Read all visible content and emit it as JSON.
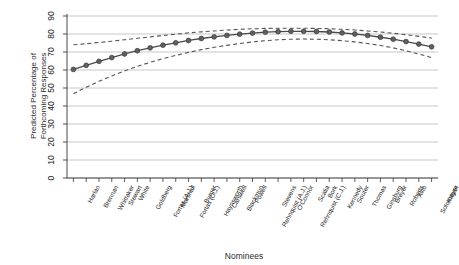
{
  "chart_data": {
    "type": "line",
    "title": "",
    "xlabel": "Nominees",
    "ylabel": "Predicted Percentage of\nForthcoming Responses",
    "ylim": [
      0,
      90
    ],
    "yticks": [
      0,
      10,
      20,
      30,
      40,
      50,
      60,
      70,
      80,
      90
    ],
    "grid": true,
    "legend": "none",
    "marker": "filled-circle",
    "line_color": "#4a4a4a",
    "band_color": "#555555",
    "band_style": "dashed",
    "categories": [
      "Harlan",
      "Brennan",
      "Whittaker",
      "Stewart",
      "White",
      "Goldberg",
      "Fortas (A.J.)",
      "Marshall",
      "Fortas (C.J.)",
      "Burger",
      "Haynsworth",
      "Carswell",
      "Blackmun",
      "Powell",
      "Rehnquist (A.J.)",
      "Stevens",
      "O'Connor",
      "Rehnquist (C.J.)",
      "Scalia",
      "Bork",
      "Kennedy",
      "Souter",
      "Thomas",
      "Ginsburg",
      "Breyer",
      "Roberts",
      "Alito",
      "Sotomayor",
      "Kagan"
    ],
    "series": [
      {
        "name": "Predicted percentage",
        "values": [
          60.3,
          62.6,
          64.8,
          66.9,
          68.9,
          70.7,
          72.3,
          73.8,
          75.1,
          76.4,
          77.5,
          78.4,
          79.2,
          79.9,
          80.5,
          81.0,
          81.3,
          81.5,
          81.5,
          81.4,
          81.1,
          80.6,
          80.0,
          79.2,
          78.2,
          77.1,
          75.8,
          74.4,
          72.9
        ]
      },
      {
        "name": "Upper confidence bound",
        "values": [
          74.0,
          74.6,
          75.3,
          76.0,
          76.8,
          77.6,
          78.4,
          79.2,
          79.9,
          80.6,
          81.2,
          81.7,
          82.2,
          82.6,
          82.9,
          83.1,
          83.2,
          83.2,
          83.2,
          83.1,
          82.9,
          82.6,
          82.2,
          81.7,
          81.1,
          80.4,
          79.6,
          78.7,
          77.7
        ]
      },
      {
        "name": "Lower confidence bound",
        "values": [
          46.8,
          50.4,
          53.7,
          56.7,
          59.5,
          62.0,
          64.3,
          66.3,
          68.1,
          69.8,
          71.3,
          72.6,
          73.7,
          74.7,
          75.6,
          76.3,
          76.8,
          77.1,
          77.2,
          77.1,
          76.8,
          76.3,
          75.6,
          74.7,
          73.6,
          72.3,
          70.7,
          68.9,
          66.9
        ]
      }
    ]
  }
}
